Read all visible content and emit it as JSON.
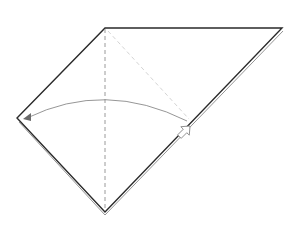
{
  "diagram": {
    "type": "origami-fold-step",
    "colors": {
      "background": "#ffffff",
      "outline": "#2a2a2a",
      "valley_fold": "#9a9a9a",
      "guide_fold": "#d4d4d4",
      "arrow": "#8a8a8a"
    },
    "paper": {
      "vertices": [
        [
          105,
          28
        ],
        [
          282,
          28
        ],
        [
          105,
          212
        ],
        [
          17,
          118
        ]
      ]
    },
    "valley_fold_line": {
      "from": [
        105,
        28
      ],
      "to": [
        105,
        212
      ]
    },
    "guide_line": {
      "from": [
        105,
        28
      ],
      "to": [
        190,
        121
      ]
    },
    "fold_arrow": {
      "from": [
        187,
        121
      ],
      "to": [
        25,
        118
      ],
      "control": [
        105,
        85
      ]
    },
    "push_arrow": {
      "at": [
        193,
        130
      ]
    }
  }
}
